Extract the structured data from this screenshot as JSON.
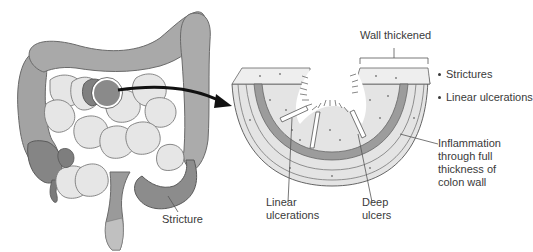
{
  "diagram": {
    "colors": {
      "colon_fill": "#a9a9a9",
      "colon_dark": "#7f7f7f",
      "small_intestine": "#e6e6e6",
      "outline": "#5a5a5a",
      "wall_band": "#9c9c9c",
      "tissue": "#e2e2e2",
      "text": "#3a3a3a",
      "arrow": "#111111"
    }
  },
  "labels": {
    "stricture": "Stricture",
    "wall_thickened": "Wall thickened",
    "inflammation": [
      "Inflammation",
      "through full",
      "thickness of",
      "colon wall"
    ],
    "linear_ulcerations": [
      "Linear",
      "ulcerations"
    ],
    "deep_ulcers": [
      "Deep",
      "ulcers"
    ]
  },
  "key_features": [
    "Strictures",
    "Linear ulcerations"
  ]
}
